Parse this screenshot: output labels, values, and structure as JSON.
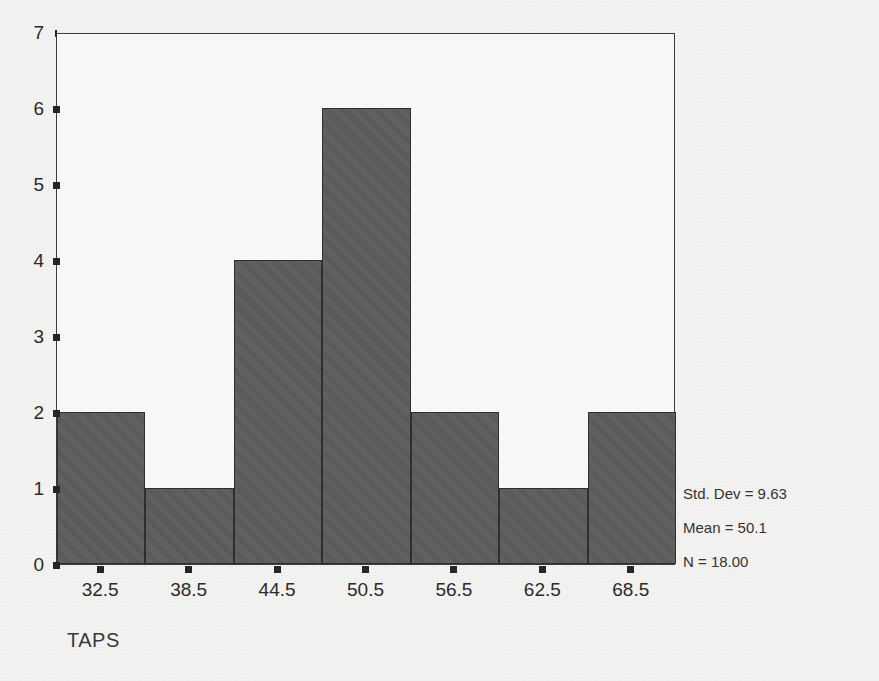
{
  "figure": {
    "background_color": "#f2f2f1",
    "plot_background_color": "#f7f7f6",
    "frame_color": "#3b3b3b",
    "bar_fill_color": "#5a5a5a",
    "bar_edge_color": "#2f2f2f"
  },
  "chart_data": {
    "type": "bar",
    "title": "",
    "subtitle": "",
    "xlabel": "TAPS",
    "ylabel": "",
    "categories": [
      "32.5",
      "38.5",
      "44.5",
      "50.5",
      "56.5",
      "62.5",
      "68.5"
    ],
    "values": [
      2,
      1,
      4,
      6,
      2,
      1,
      2
    ],
    "xlim": [
      29.5,
      71.5
    ],
    "ylim": [
      0,
      7
    ],
    "bin_width": 6,
    "x_tick_labels": [
      "32.5",
      "38.5",
      "44.5",
      "50.5",
      "56.5",
      "62.5",
      "68.5"
    ],
    "y_tick_labels": [
      "0",
      "1",
      "2",
      "3",
      "4",
      "5",
      "6",
      "7"
    ],
    "y_tick_values": [
      0,
      1,
      2,
      3,
      4,
      5,
      6,
      7
    ],
    "grid": false,
    "legend": null,
    "annotations": [
      "Std. Dev = 9.63",
      "Mean = 50.1",
      "N = 18.00"
    ]
  },
  "axes": {
    "x_title": "TAPS",
    "y_title": ""
  },
  "statistics": {
    "std_dev_line": "Std. Dev = 9.63",
    "mean_line": "Mean = 50.1",
    "n_line": "N = 18.00"
  }
}
